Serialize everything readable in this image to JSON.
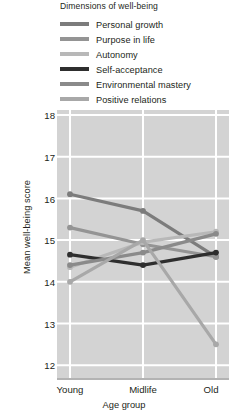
{
  "legend": {
    "title": "Dimensions of well-being",
    "entries": [
      {
        "label": "Personal growth",
        "color": "#7c7c7c"
      },
      {
        "label": "Purpose in life",
        "color": "#949494"
      },
      {
        "label": "Autonomy",
        "color": "#b8b8b8"
      },
      {
        "label": "Self-acceptance",
        "color": "#2e2e2e"
      },
      {
        "label": "Environmental mastery",
        "color": "#8a8a8a"
      },
      {
        "label": "Positive relations",
        "color": "#a8a8a8"
      }
    ]
  },
  "axes": {
    "ylabel": "Mean well-being score",
    "xlabel": "Age group",
    "yticks": [
      "18",
      "17",
      "16",
      "15",
      "14",
      "13",
      "12"
    ],
    "xticks": [
      "Young",
      "Midlife",
      "Old"
    ]
  },
  "style": {
    "plot_background": "#d3d3d3",
    "gridline_color": "#ffffff",
    "axis_color": "#9a9a9a"
  },
  "chart_data": {
    "type": "line",
    "title": "Dimensions of well-being",
    "xlabel": "Age group",
    "ylabel": "Mean well-being score",
    "categories": [
      "Young",
      "Midlife",
      "Old"
    ],
    "ylim": [
      12,
      18
    ],
    "yticks": [
      12,
      13,
      14,
      15,
      16,
      17,
      18
    ],
    "grid": true,
    "legend_position": "top",
    "series": [
      {
        "name": "Personal growth",
        "color": "#7c7c7c",
        "values": [
          16.1,
          15.7,
          14.6
        ]
      },
      {
        "name": "Purpose in life",
        "color": "#949494",
        "values": [
          15.3,
          14.9,
          14.6
        ]
      },
      {
        "name": "Autonomy",
        "color": "#b8b8b8",
        "values": [
          14.35,
          14.95,
          15.2
        ]
      },
      {
        "name": "Self-acceptance",
        "color": "#2e2e2e",
        "values": [
          14.65,
          14.4,
          14.7
        ]
      },
      {
        "name": "Environmental mastery",
        "color": "#8a8a8a",
        "values": [
          14.4,
          14.7,
          15.15
        ]
      },
      {
        "name": "Positive relations",
        "color": "#a8a8a8",
        "values": [
          14.0,
          15.0,
          12.5
        ]
      }
    ]
  }
}
